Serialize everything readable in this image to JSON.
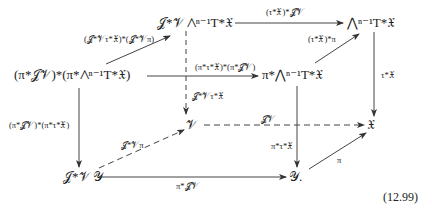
{
  "diagram": {
    "nodes": {
      "top_mid": "𝒥*𝒱 ⋀ⁿ⁻¹T*𝔛",
      "top_right": "⋀ⁿ⁻¹T*𝔛",
      "mid_left": "(π*𝒥𝒱)*(π*⋀ⁿ⁻¹T*𝔛)",
      "mid_center": "π*⋀ⁿ⁻¹T*𝔛",
      "V": "𝒱",
      "X": "𝔛",
      "bottom_left": "𝒥*𝒱 𝒴",
      "Y": "𝒴."
    },
    "labels": {
      "top_arrow": "(τ*𝔛)*𝒥𝒱",
      "diag_top_left": "(𝒥*𝒱τ*𝔛)*(𝒥*𝒱π)",
      "diag_top_right": "(τ*𝔛)*π",
      "mid_horizontal": "(π*τ*𝔛)*(π*𝒥𝒱)",
      "dashed_vertical": "𝒥*𝒱τ*𝔛",
      "right_vertical": "τ*𝔛",
      "left_vertical": "(π*𝒥𝒱)*(π*τ*𝔛)",
      "dashed_horizontal": "𝒥𝒱",
      "dashed_diag": "𝒥*𝒱π",
      "center_vertical": "π*τ*𝔛",
      "bottom_arrow": "π*𝒥𝒱",
      "pi_arrow": "π"
    },
    "equation_number": "(12.99)"
  }
}
